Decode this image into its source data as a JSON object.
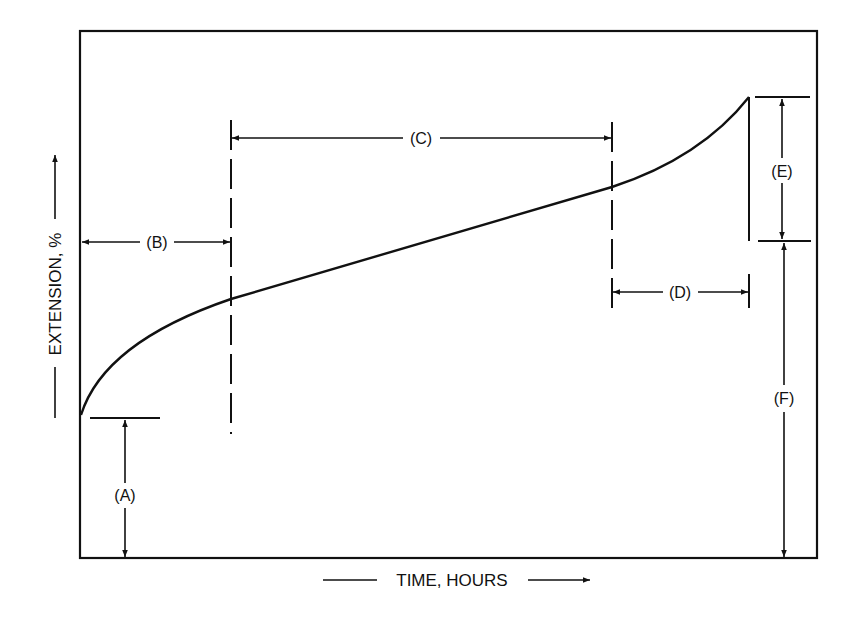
{
  "diagram": {
    "type": "creep-curve",
    "x_axis_label": "TIME, HOURS",
    "y_axis_label": "EXTENSION, %",
    "labels": {
      "A": "(A)",
      "B": "(B)",
      "C": "(C)",
      "D": "(D)",
      "E": "(E)",
      "F": "(F)"
    },
    "regions": [
      {
        "id": "A",
        "meaning": "initial extension at load application"
      },
      {
        "id": "B",
        "meaning": "primary stage duration"
      },
      {
        "id": "C",
        "meaning": "secondary stage duration"
      },
      {
        "id": "D",
        "meaning": "tertiary stage duration"
      },
      {
        "id": "E",
        "meaning": "extension drop at rupture"
      },
      {
        "id": "F",
        "meaning": "extension after rupture"
      }
    ],
    "colors": {
      "ink": "#111111",
      "background": "#ffffff"
    }
  }
}
